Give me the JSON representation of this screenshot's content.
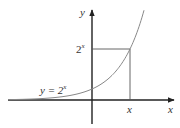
{
  "diagram": {
    "type": "function-graph",
    "function": "y = 2^x",
    "axis_labels": {
      "x": "x",
      "y": "y"
    },
    "curve_label": {
      "lhs": "y = 2",
      "exp": "x"
    },
    "point_labels": {
      "x_tick": "x",
      "y_tick_base": "2",
      "y_tick_exp": "x"
    },
    "colors": {
      "axis": "#222222",
      "curve": "#888888",
      "guide": "#555555",
      "text": "#333333"
    }
  }
}
